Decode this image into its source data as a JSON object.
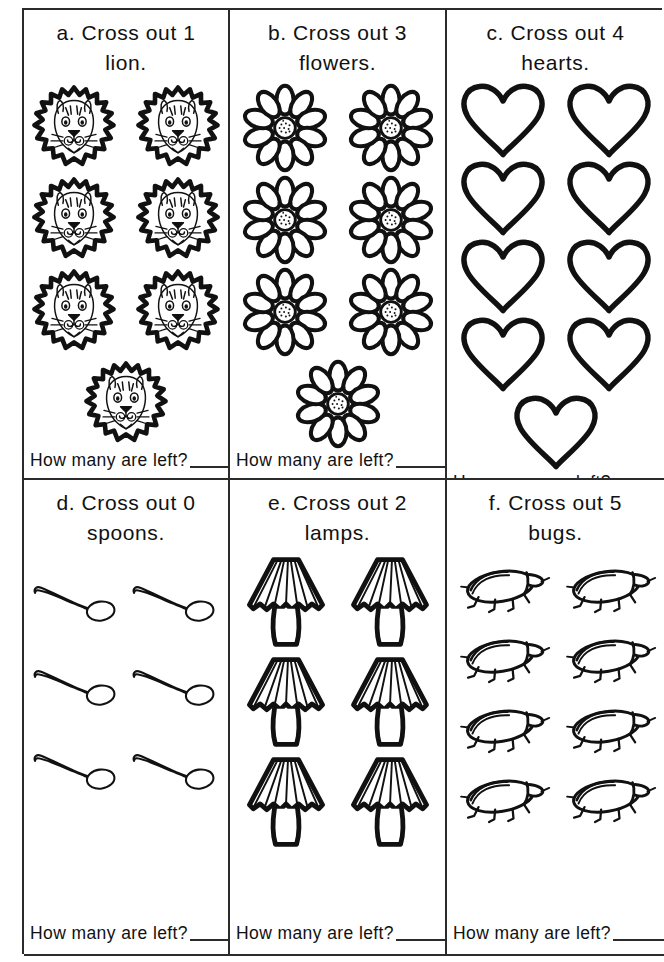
{
  "worksheet": {
    "question_suffix": "How many are left?",
    "answer_blank": "",
    "ink_color": "#2b2b2b",
    "paper_color": "#ffffff"
  },
  "cells": [
    {
      "id": "a",
      "letter": "a.",
      "prompt_line1": "a. Cross out 1",
      "prompt_line2": "lion.",
      "instruction": "Cross out",
      "cross_out_count": "1",
      "object_name": "lion",
      "object_plural": "lions",
      "icon": "lion-icon",
      "total_objects": 7,
      "rows": [
        2,
        2,
        2,
        1
      ],
      "question": "How many are left?",
      "answer": ""
    },
    {
      "id": "b",
      "letter": "b.",
      "prompt_line1": "b. Cross out 3",
      "prompt_line2": "flowers.",
      "instruction": "Cross out",
      "cross_out_count": "3",
      "object_name": "flower",
      "object_plural": "flowers",
      "icon": "flower-icon",
      "total_objects": 7,
      "rows": [
        2,
        2,
        2,
        1
      ],
      "question": "How many are left?",
      "answer": ""
    },
    {
      "id": "c",
      "letter": "c.",
      "prompt_line1": "c. Cross out 4",
      "prompt_line2": "hearts.",
      "instruction": "Cross out",
      "cross_out_count": "4",
      "object_name": "heart",
      "object_plural": "hearts",
      "icon": "heart-icon",
      "total_objects": 9,
      "rows": [
        2,
        2,
        2,
        2,
        1
      ],
      "question": "How many are left?",
      "answer": ""
    },
    {
      "id": "d",
      "letter": "d.",
      "prompt_line1": "d. Cross out 0",
      "prompt_line2": "spoons.",
      "instruction": "Cross out",
      "cross_out_count": "0",
      "object_name": "spoon",
      "object_plural": "spoons",
      "icon": "spoon-icon",
      "total_objects": 6,
      "rows": [
        2,
        2,
        2
      ],
      "question": "How many are left?",
      "answer": ""
    },
    {
      "id": "e",
      "letter": "e.",
      "prompt_line1": "e. Cross out 2",
      "prompt_line2": "lamps.",
      "instruction": "Cross out",
      "cross_out_count": "2",
      "object_name": "lamp",
      "object_plural": "lamps",
      "icon": "lamp-icon",
      "total_objects": 6,
      "rows": [
        2,
        2,
        2
      ],
      "question": "How many are left?",
      "answer": ""
    },
    {
      "id": "f",
      "letter": "f.",
      "prompt_line1": "f. Cross out 5",
      "prompt_line2": "bugs.",
      "instruction": "Cross out",
      "cross_out_count": "5",
      "object_name": "bug",
      "object_plural": "bugs",
      "icon": "bug-icon",
      "total_objects": 8,
      "rows": [
        2,
        2,
        2,
        2
      ],
      "question": "How many are left?",
      "answer": ""
    }
  ]
}
